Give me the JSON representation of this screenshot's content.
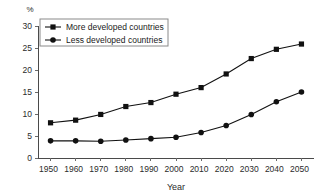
{
  "chart_data": {
    "type": "line",
    "title": "",
    "xlabel": "Year",
    "ylabel": "",
    "unit_label": "%",
    "x": [
      1950,
      1960,
      1970,
      1980,
      1990,
      2000,
      2010,
      2020,
      2030,
      2040,
      2050
    ],
    "xticklabels": [
      "1950",
      "1960",
      "1970",
      "1980",
      "1990",
      "2000",
      "2010",
      "2020",
      "2030",
      "2040",
      "2050"
    ],
    "yticklabels": [
      "0",
      "5",
      "10",
      "15",
      "20",
      "25",
      "30"
    ],
    "yticks": [
      0,
      5,
      10,
      15,
      20,
      25,
      30
    ],
    "xlim": [
      1945,
      2055
    ],
    "ylim": [
      0,
      30
    ],
    "grid": false,
    "legend_position": "upper left",
    "series": [
      {
        "name": "More developed countries",
        "marker": "square",
        "color": "#111111",
        "values": [
          8.0,
          8.6,
          9.9,
          11.7,
          12.6,
          14.5,
          16.0,
          19.1,
          22.6,
          24.7,
          25.9
        ]
      },
      {
        "name": "Less developed countries",
        "marker": "circle",
        "color": "#111111",
        "values": [
          3.9,
          3.9,
          3.8,
          4.1,
          4.4,
          4.7,
          5.8,
          7.4,
          9.9,
          12.8,
          15.0
        ]
      }
    ]
  },
  "legend": {
    "items": [
      {
        "label": "More developed countries",
        "marker": "square-marker-icon"
      },
      {
        "label": "Less developed countries",
        "marker": "circle-marker-icon"
      }
    ]
  },
  "axes": {
    "x_title": "Year",
    "y_unit": "%"
  }
}
